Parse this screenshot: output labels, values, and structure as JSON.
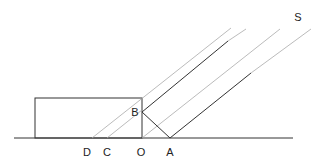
{
  "diagram": {
    "labels": {
      "S": "S",
      "B": "B",
      "D": "D",
      "C": "C",
      "O": "O",
      "A": "A"
    },
    "colors": {
      "dark_line": "#333333",
      "light_line": "#aaaaaa",
      "background": "#ffffff"
    }
  }
}
